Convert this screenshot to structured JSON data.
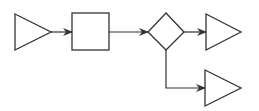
{
  "diagram": {
    "type": "flow",
    "stroke_color": "#333333",
    "fill_color": "#ffffff",
    "background": "#ffffff",
    "nodes": [
      {
        "id": "start",
        "shape": "triangle-right",
        "label": ""
      },
      {
        "id": "process",
        "shape": "rectangle",
        "label": ""
      },
      {
        "id": "decision",
        "shape": "diamond",
        "label": ""
      },
      {
        "id": "output-top",
        "shape": "triangle-right",
        "label": ""
      },
      {
        "id": "output-bottom",
        "shape": "triangle-right",
        "label": ""
      }
    ],
    "edges": [
      {
        "from": "start",
        "to": "process",
        "arrow": "end"
      },
      {
        "from": "process",
        "to": "decision",
        "arrow": "end"
      },
      {
        "from": "decision",
        "to": "output-top",
        "arrow": "end"
      },
      {
        "from": "decision",
        "to": "output-bottom",
        "arrow": "end",
        "route": "down-then-right"
      }
    ]
  }
}
